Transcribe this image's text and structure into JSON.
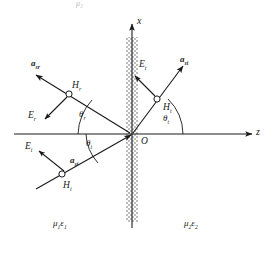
{
  "figure": {
    "title_fragment": "μ₃",
    "interface": {
      "name": "dielectric-interface-band",
      "fill": "#c9c9c9"
    },
    "axes": {
      "vertical": {
        "label": "x",
        "name": "x-axis"
      },
      "horizontal": {
        "label": "z",
        "name": "z-axis"
      },
      "origin": {
        "label": "O"
      }
    },
    "stroke_color": "#1a1a1a",
    "rays": [
      {
        "id": "incident",
        "name": "incident-ray",
        "propagation_label": "a",
        "propagation_sub": "si",
        "e_label": "E",
        "e_sub": "i",
        "h_label": "H",
        "h_sub": "i",
        "angle_label": "θ",
        "angle_sub": "i"
      },
      {
        "id": "reflected",
        "name": "reflected-ray",
        "propagation_label": "a",
        "propagation_sub": "sr",
        "e_label": "E",
        "e_sub": "r",
        "h_label": "H",
        "h_sub": "r",
        "angle_label": "θ",
        "angle_sub": "r"
      },
      {
        "id": "transmitted",
        "name": "transmitted-ray",
        "propagation_label": "a",
        "propagation_sub": "st",
        "e_label": "E",
        "e_sub": "t",
        "h_label": "H",
        "h_sub": "t",
        "angle_label": "θ",
        "angle_sub": "t"
      }
    ],
    "media": [
      {
        "name": "medium-1-label",
        "mu": "μ",
        "mu_sub": "1",
        "eps": "ε",
        "eps_sub": "1"
      },
      {
        "name": "medium-2-label",
        "mu": "μ",
        "mu_sub": "2",
        "eps": "ε",
        "eps_sub": "2"
      }
    ]
  }
}
